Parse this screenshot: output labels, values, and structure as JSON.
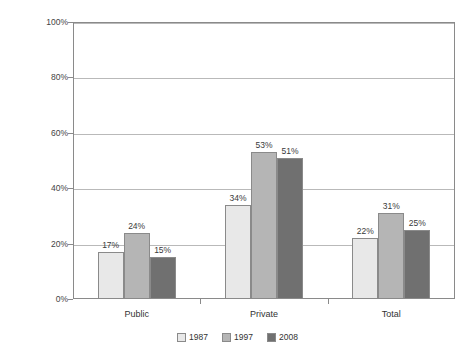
{
  "chart_data": {
    "type": "bar",
    "title": "",
    "subtitle": "",
    "xlabel": "",
    "ylabel": "Percentage of Elementary Schools",
    "categories": [
      "Public",
      "Private",
      "Total"
    ],
    "series": [
      {
        "name": "1987",
        "color": "#e8e8e8",
        "values": [
          17,
          24,
          22
        ]
      },
      {
        "name": "1997",
        "color": "#b5b5b5",
        "values": [
          34,
          53,
          31
        ]
      },
      {
        "name": "2008",
        "color": "#707070",
        "values": [
          15,
          51,
          25
        ]
      }
    ],
    "series_by_category": [
      {
        "category": "Public",
        "values": [
          17,
          24,
          15
        ]
      },
      {
        "category": "Private",
        "values": [
          34,
          53,
          51
        ]
      },
      {
        "category": "Total",
        "values": [
          22,
          31,
          25
        ]
      }
    ],
    "data_labels": [
      [
        "17%",
        "24%",
        "15%"
      ],
      [
        "34%",
        "53%",
        "51%"
      ],
      [
        "22%",
        "31%",
        "25%"
      ]
    ],
    "ylim": [
      0,
      100
    ],
    "yticks": [
      0,
      20,
      40,
      60,
      80,
      100
    ],
    "ytick_labels": [
      "0%",
      "20%",
      "40%",
      "60%",
      "80%",
      "100%"
    ],
    "grid": true,
    "grid_axis": "y",
    "legend_position": "bottom",
    "legend_entries": [
      "1987",
      "1997",
      "2008"
    ],
    "value_suffix": "%",
    "colors": {
      "series_1987": "#e8e8e8",
      "series_1997": "#b5b5b5",
      "series_2008": "#707070",
      "axis": "#8a8a8a",
      "grid": "#b9b9b9",
      "text": "#333333",
      "background": "#ffffff"
    }
  }
}
